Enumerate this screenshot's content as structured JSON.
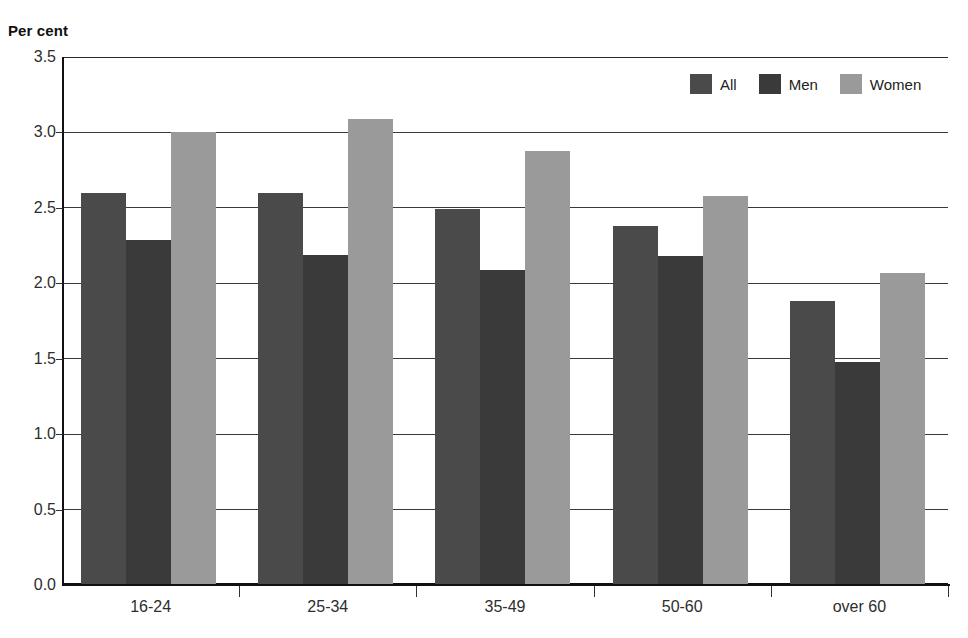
{
  "chart_data": {
    "type": "bar",
    "title": "",
    "subtitle": "",
    "xlabel": "",
    "ylabel": "Per cent",
    "ylim": [
      0.0,
      3.5
    ],
    "yticks": [
      "0.0",
      "0.5",
      "1.0",
      "1.5",
      "2.0",
      "2.5",
      "3.0",
      "3.5"
    ],
    "ytick_values": [
      0.0,
      0.5,
      1.0,
      1.5,
      2.0,
      2.5,
      3.0,
      3.5
    ],
    "grid": true,
    "legend_position": "top-right",
    "categories": [
      "16-24",
      "25-34",
      "35-49",
      "50-60",
      "over 60"
    ],
    "series": [
      {
        "name": "All",
        "color": "#4a4a4a",
        "values": [
          2.6,
          2.6,
          2.49,
          2.38,
          1.88
        ]
      },
      {
        "name": "Men",
        "color": "#3a3a3a",
        "values": [
          2.29,
          2.19,
          2.09,
          2.18,
          1.48
        ]
      },
      {
        "name": "Women",
        "color": "#9a9a9a",
        "values": [
          3.0,
          3.09,
          2.88,
          2.58,
          2.07
        ]
      }
    ],
    "annotations": []
  },
  "axis": {
    "y_title": "Per cent"
  },
  "legend": {
    "entries": [
      {
        "label": "All"
      },
      {
        "label": "Men"
      },
      {
        "label": "Women"
      }
    ]
  }
}
